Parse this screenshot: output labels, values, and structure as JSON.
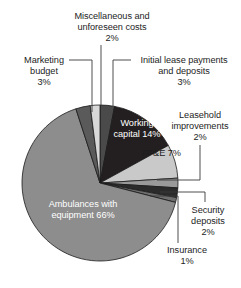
{
  "chart_data": {
    "type": "pie",
    "title": "",
    "subtitle": "",
    "xlabel": "",
    "ylabel": "",
    "grid": false,
    "legend_position": "none",
    "label_format": "name + percent",
    "start_angle_deg": 0,
    "direction": "clockwise",
    "categories": [
      "Initial lease payments and deposits",
      "Working capital",
      "FF&E",
      "Leasehold improvements",
      "Security deposits",
      "Insurance",
      "Ambulances with equipment",
      "Marketing budget",
      "Miscellaneous and unforeseen costs"
    ],
    "values": [
      3,
      14,
      7,
      2,
      2,
      1,
      66,
      3,
      2
    ],
    "units": "percent",
    "total": 100,
    "slices": [
      {
        "name": "Initial lease payments and deposits",
        "value": 3,
        "percent_label": "3%",
        "color": "#4a4a4a",
        "label_placement": "callout"
      },
      {
        "name": "Working capital",
        "value": 14,
        "percent_label": "14%",
        "color": "#231f20",
        "label_placement": "inside"
      },
      {
        "name": "FF&E",
        "value": 7,
        "percent_label": "7%",
        "color": "#c9c9c9",
        "label_placement": "inside"
      },
      {
        "name": "Leasehold improvements",
        "value": 2,
        "percent_label": "2%",
        "color": "#9a9a9a",
        "label_placement": "callout"
      },
      {
        "name": "Security deposits",
        "value": 2,
        "percent_label": "2%",
        "color": "#2b2b2b",
        "label_placement": "callout"
      },
      {
        "name": "Insurance",
        "value": 1,
        "percent_label": "1%",
        "color": "#6e6e6e",
        "label_placement": "callout"
      },
      {
        "name": "Ambulances with equipment",
        "value": 66,
        "percent_label": "66%",
        "color": "#8d8d8d",
        "label_placement": "inside"
      },
      {
        "name": "Marketing budget",
        "value": 3,
        "percent_label": "3%",
        "color": "#5a5a5a",
        "label_placement": "callout"
      },
      {
        "name": "Miscellaneous and unforeseen costs",
        "value": 2,
        "percent_label": "2%",
        "color": "#d8d8d8",
        "label_placement": "callout"
      }
    ]
  },
  "labels": {
    "misc": {
      "line1": "Miscellaneous and",
      "line2": "unforeseen costs",
      "pct": "2%"
    },
    "marketing": {
      "line1": "Marketing",
      "line2": "budget",
      "pct": "3%"
    },
    "initial": {
      "line1": "Initial lease payments",
      "line2": "and deposits",
      "pct": "3%"
    },
    "leasehold": {
      "line1": "Leasehold",
      "line2": "improvements",
      "pct": "2%"
    },
    "security": {
      "line1": "Security",
      "line2": "deposits",
      "pct": "2%"
    },
    "insurance": {
      "line1": "Insurance",
      "pct": "1%"
    },
    "working": {
      "line1": "Working",
      "line2": "capital",
      "pct": "14%"
    },
    "ffe": {
      "line1": "FF&E",
      "pct": "7%"
    },
    "ambulances": {
      "line1": "Ambulances with",
      "line2": "equipment",
      "pct": "66%"
    }
  },
  "colors": {
    "background": "#ffffff",
    "outline": "#1a1a1a",
    "leader": "#3a3a3a",
    "text_dark": "#1d1d1d",
    "text_light": "#ffffff"
  }
}
